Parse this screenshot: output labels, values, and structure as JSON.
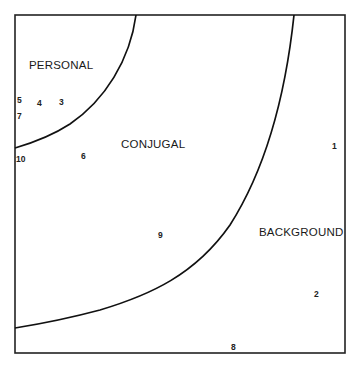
{
  "diagram": {
    "regions": [
      {
        "id": "personal",
        "label": "PERSONAL",
        "x": 29,
        "y": 69
      },
      {
        "id": "conjugal",
        "label": "CONJUGAL",
        "x": 121,
        "y": 148
      },
      {
        "id": "background",
        "label": "BACKGROUND",
        "x": 259,
        "y": 236
      }
    ],
    "points": [
      {
        "label": "1",
        "x": 332,
        "y": 149
      },
      {
        "label": "2",
        "x": 314,
        "y": 297
      },
      {
        "label": "3",
        "x": 59,
        "y": 105
      },
      {
        "label": "4",
        "x": 37,
        "y": 106
      },
      {
        "label": "5",
        "x": 17,
        "y": 103
      },
      {
        "label": "6",
        "x": 81,
        "y": 159
      },
      {
        "label": "7",
        "x": 17,
        "y": 119
      },
      {
        "label": "8",
        "x": 231,
        "y": 350
      },
      {
        "label": "9",
        "x": 158,
        "y": 238
      },
      {
        "label": "10",
        "x": 16,
        "y": 162
      }
    ],
    "colors": {
      "line": "#111111",
      "text": "#1a1a1a",
      "background": "#ffffff"
    }
  }
}
